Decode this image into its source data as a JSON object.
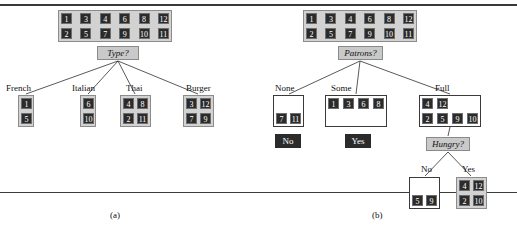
{
  "figure": {
    "rule_top": true,
    "rule_bottom": true,
    "captions": [
      {
        "text": "(a)",
        "x": 110,
        "y": 215
      },
      {
        "text": "(b)",
        "x": 372,
        "y": 215
      }
    ]
  },
  "trees": [
    {
      "id": "tree-a",
      "caption": "(a)",
      "root_set": {
        "name": "root-example-set-a",
        "x": 58,
        "y": 10,
        "w": 114,
        "h": 32,
        "rows": [
          [
            "1",
            "3",
            "4",
            "6",
            "8",
            "12"
          ],
          [
            "2",
            "5",
            "7",
            "9",
            "10",
            "11"
          ]
        ]
      },
      "decision": {
        "name": "decision-node-type",
        "label": "Type?",
        "x": 97,
        "y": 46,
        "w": 42,
        "h": 14
      },
      "branches": [
        {
          "name": "branch-french",
          "label": "French",
          "label_x": 6,
          "label_y": 84,
          "box": {
            "x": 18,
            "y": 95,
            "w": 16,
            "h": 32,
            "rows": [
              [
                "1"
              ],
              [
                "5"
              ]
            ]
          }
        },
        {
          "name": "branch-italian",
          "label": "Italian",
          "label_x": 72,
          "label_y": 84,
          "box": {
            "x": 80,
            "y": 95,
            "w": 16,
            "h": 32,
            "rows": [
              [
                "6"
              ],
              [
                "10"
              ]
            ]
          }
        },
        {
          "name": "branch-thai",
          "label": "Thai",
          "label_x": 126,
          "label_y": 84,
          "box": {
            "x": 120,
            "y": 95,
            "w": 31,
            "h": 32,
            "rows": [
              [
                "4",
                "8"
              ],
              [
                "2",
                "11"
              ]
            ]
          }
        },
        {
          "name": "branch-burger",
          "label": "Burger",
          "label_x": 186,
          "label_y": 84,
          "box": {
            "x": 183,
            "y": 95,
            "w": 31,
            "h": 32,
            "rows": [
              [
                "3",
                "12"
              ],
              [
                "7",
                "9"
              ]
            ]
          }
        }
      ]
    },
    {
      "id": "tree-b",
      "caption": "(b)",
      "root_set": {
        "name": "root-example-set-b",
        "x": 303,
        "y": 10,
        "w": 114,
        "h": 32,
        "rows": [
          [
            "1",
            "3",
            "4",
            "6",
            "8",
            "12"
          ],
          [
            "2",
            "5",
            "7",
            "9",
            "10",
            "11"
          ]
        ]
      },
      "decision": {
        "name": "decision-node-patrons",
        "label": "Patrons?",
        "x": 338,
        "y": 46,
        "w": 45,
        "h": 14
      },
      "branches": [
        {
          "name": "branch-none",
          "label": "None",
          "label_x": 275,
          "label_y": 84,
          "box": {
            "x": 273,
            "y": 95,
            "w": 31,
            "h": 32,
            "rows": [
              [
                "",
                ""
              ],
              [
                "7",
                "11"
              ]
            ],
            "plain": true
          },
          "answer": {
            "name": "leaf-answer-no",
            "label": "No",
            "x": 275,
            "y": 134,
            "w": 26,
            "h": 14
          }
        },
        {
          "name": "branch-some",
          "label": "Some",
          "label_x": 331,
          "label_y": 84,
          "box": {
            "x": 325,
            "y": 95,
            "w": 62,
            "h": 32,
            "rows": [
              [
                "1",
                "3",
                "6",
                "8"
              ],
              [
                "",
                "",
                "",
                ""
              ]
            ],
            "plain": true
          },
          "answer": {
            "name": "leaf-answer-yes",
            "label": "Yes",
            "x": 345,
            "y": 134,
            "w": 26,
            "h": 14
          }
        },
        {
          "name": "branch-full",
          "label": "Full",
          "label_x": 435,
          "label_y": 84,
          "box": {
            "x": 419,
            "y": 95,
            "w": 62,
            "h": 32,
            "rows": [
              [
                "4",
                "12",
                "",
                ""
              ],
              [
                "2",
                "5",
                "9",
                "10"
              ]
            ],
            "plain": true
          },
          "subtree": {
            "name": "decision-node-hungry",
            "label": "Hungry?",
            "x": 426,
            "y": 137,
            "w": 44,
            "h": 14,
            "branches": [
              {
                "name": "branch-hungry-no",
                "label": "No",
                "label_x": 421,
                "label_y": 165,
                "box": {
                  "x": 409,
                  "y": 177,
                  "w": 31,
                  "h": 32,
                  "rows": [
                    [
                      "",
                      ""
                    ],
                    [
                      "5",
                      "9"
                    ]
                  ],
                  "plain": true
                }
              },
              {
                "name": "branch-hungry-yes",
                "label": "Yes",
                "label_x": 462,
                "label_y": 165,
                "box": {
                  "x": 456,
                  "y": 177,
                  "w": 31,
                  "h": 32,
                  "rows": [
                    [
                      "4",
                      "12"
                    ],
                    [
                      "2",
                      "10"
                    ]
                  ]
                }
              }
            ]
          }
        }
      ]
    }
  ],
  "colors": {
    "chip_fill": "#2b2b2b",
    "chip_text": "#ffffff",
    "set_box_fill": "#d2d2d2",
    "decision_fill": "#c9c9c9",
    "leaf_fill": "#2b2b2b",
    "edge": "#2f2f2f",
    "rule": "#3a3a3a"
  }
}
